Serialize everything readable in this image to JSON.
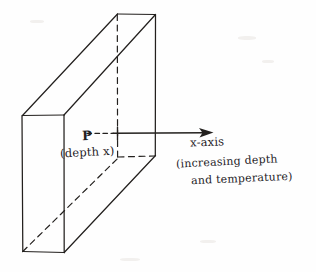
{
  "figure": {
    "background_color": "#fefefe",
    "ink_color": "#23201e",
    "labels": {
      "point_p": "P",
      "depth_annotation": "(depth x)",
      "axis_name": "x-axis",
      "axis_note_line1": "(increasing depth",
      "axis_note_line2": "and temperature)"
    },
    "geometry": {
      "front_face": {
        "top_left": [
          22,
          115
        ],
        "top_right": [
          64,
          115
        ],
        "bottom_right": [
          64,
          252
        ],
        "bottom_left": [
          22,
          252
        ]
      },
      "back_face": {
        "top_left": [
          117,
          14
        ],
        "top_right": [
          155,
          14
        ],
        "bottom_right": [
          155,
          155
        ],
        "bottom_left": [
          117,
          157
        ]
      },
      "hidden_edges": [
        "back-left-vertical",
        "bottom-back-diagonal"
      ],
      "axis": {
        "y": 133,
        "dashed_from_x": 87,
        "tick_x": 117,
        "solid_to_x": 206,
        "arrow_tip_x": 213
      },
      "dashed_depth_line": {
        "y": 157,
        "from_x": 118,
        "to_x": 155
      }
    }
  }
}
